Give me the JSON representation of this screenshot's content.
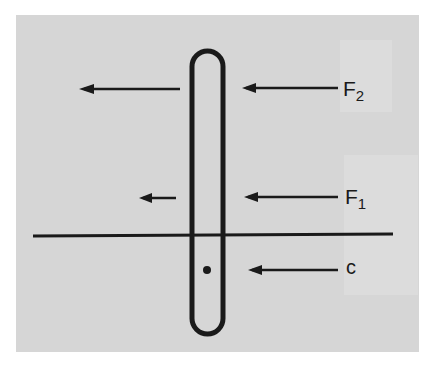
{
  "diagram": {
    "labels": {
      "f2_main": "F",
      "f2_sub": "2",
      "f1_main": "F",
      "f1_sub": "1",
      "c": "c"
    },
    "colors": {
      "background": "#ffffff",
      "panel": "#d6d6d6",
      "ink": "#1a1a1a"
    }
  }
}
